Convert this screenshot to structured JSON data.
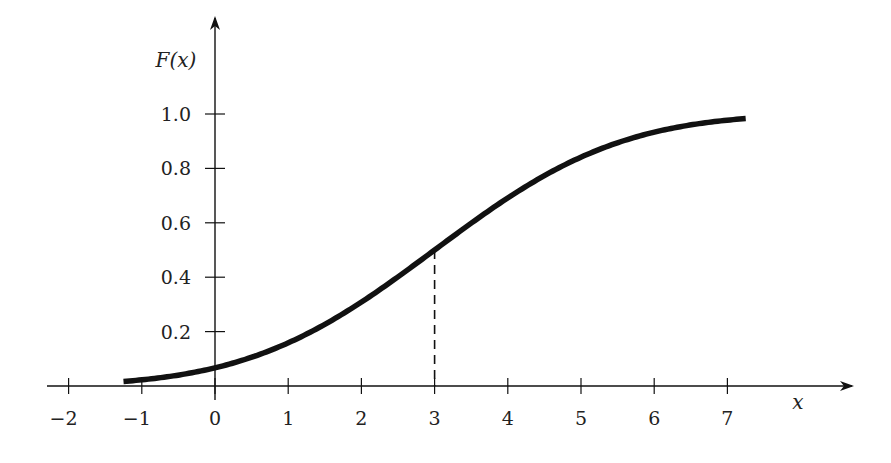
{
  "chart_data": {
    "type": "line",
    "title": "",
    "xlabel": "x",
    "ylabel": "F(x)",
    "xlim": [
      -2.3,
      8.7
    ],
    "ylim": [
      0,
      1.25
    ],
    "x_ticks": [
      -2,
      -1,
      0,
      1,
      2,
      3,
      4,
      5,
      6,
      7
    ],
    "x_tick_labels": [
      "−2",
      "−1",
      "0",
      "1",
      "2",
      "3",
      "4",
      "5",
      "6",
      "7"
    ],
    "y_ticks": [
      0.2,
      0.4,
      0.6,
      0.8,
      1.0
    ],
    "y_tick_labels": [
      "0.2",
      "0.4",
      "0.6",
      "0.8",
      "1.0"
    ],
    "grid": false,
    "legend": null,
    "series": [
      {
        "name": "F(x)",
        "description": "Normal CDF, mean 3, std dev 2",
        "mean": 3,
        "std": 2,
        "x_range": [
          -1.25,
          7.25
        ],
        "x": [
          -1.25,
          -1,
          0,
          1,
          2,
          3,
          4,
          5,
          6,
          7,
          7.25
        ],
        "values": [
          0.017,
          0.023,
          0.067,
          0.159,
          0.309,
          0.5,
          0.691,
          0.841,
          0.933,
          0.977,
          0.983
        ]
      }
    ],
    "annotations": [
      {
        "type": "dashed-vertical-line",
        "x": 3,
        "y_from": 0,
        "y_to": 0.5
      }
    ]
  }
}
